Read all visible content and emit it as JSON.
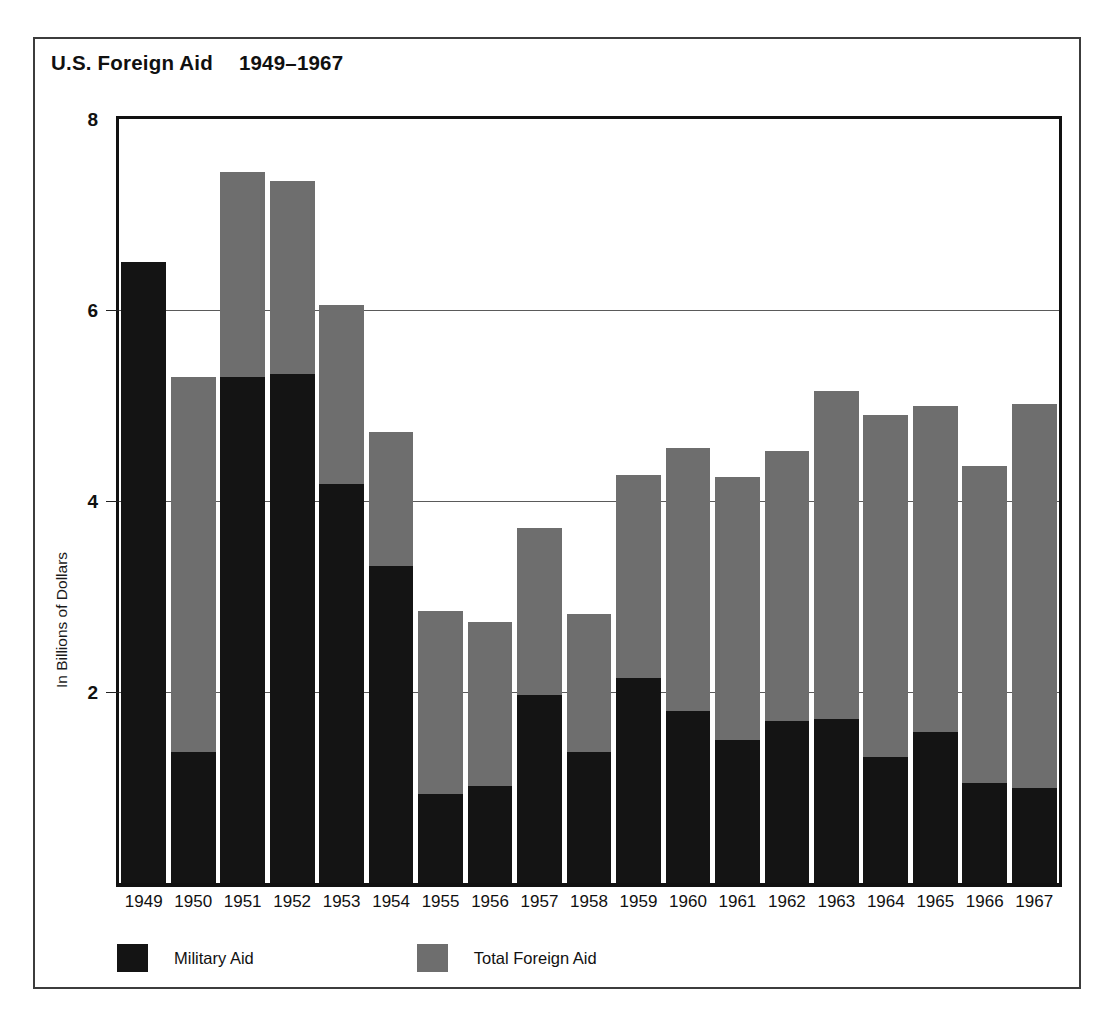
{
  "chart_data": {
    "type": "bar",
    "subtype": "overlaid-bar",
    "title": "U.S. Foreign Aid",
    "title_range": "1949–1967",
    "xlabel": "",
    "ylabel": "In Billions of Dollars",
    "ylim": [
      0,
      8
    ],
    "yticks": [
      8,
      6,
      4,
      2
    ],
    "ytick_labels": [
      "8",
      "6",
      "4",
      "2"
    ],
    "grid": true,
    "grid_axis": "y",
    "legend_position": "bottom-left",
    "categories": [
      "1949",
      "1950",
      "1951",
      "1952",
      "1953",
      "1954",
      "1955",
      "1956",
      "1957",
      "1958",
      "1959",
      "1960",
      "1961",
      "1962",
      "1963",
      "1964",
      "1965",
      "1966",
      "1967"
    ],
    "series": [
      {
        "name": "Total Foreign Aid",
        "color": "#6e6e6e",
        "values": [
          6.5,
          5.3,
          7.45,
          7.35,
          6.05,
          4.72,
          2.85,
          2.73,
          3.72,
          2.82,
          4.27,
          4.55,
          4.25,
          4.52,
          5.15,
          4.9,
          5.0,
          4.37,
          5.02
        ]
      },
      {
        "name": "Military Aid",
        "color": "#141414",
        "values": [
          6.5,
          1.37,
          5.3,
          5.33,
          4.18,
          3.32,
          0.93,
          1.02,
          1.97,
          1.37,
          2.15,
          1.8,
          1.5,
          1.7,
          1.72,
          1.32,
          1.58,
          1.05,
          1.0
        ]
      }
    ]
  },
  "legend": {
    "items": [
      {
        "label": "Military Aid",
        "swatch": "military"
      },
      {
        "label": "Total Foreign Aid",
        "swatch": "total"
      }
    ]
  }
}
